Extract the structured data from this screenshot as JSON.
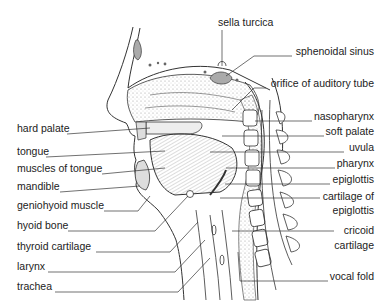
{
  "diagram": {
    "type": "anatomical sagittal section of head and neck",
    "labels_left": [
      {
        "text": "hard palate",
        "x": 17,
        "y": 128
      },
      {
        "text": "tongue",
        "x": 17,
        "y": 151
      },
      {
        "text": "muscles of tongue",
        "x": 17,
        "y": 168
      },
      {
        "text": "mandible",
        "x": 17,
        "y": 186
      },
      {
        "text": "geniohyoid muscle",
        "x": 17,
        "y": 205
      },
      {
        "text": "hyoid bone",
        "x": 17,
        "y": 225
      },
      {
        "text": "thyroid cartilage",
        "x": 17,
        "y": 245
      },
      {
        "text": "larynx",
        "x": 17,
        "y": 266
      },
      {
        "text": "trachea",
        "x": 17,
        "y": 286
      }
    ],
    "labels_top": [
      {
        "text": "sella turcica",
        "x": 218,
        "y": 22
      }
    ],
    "labels_right": [
      {
        "text": "sphenoidal sinus",
        "y": 51
      },
      {
        "text": "orifice of auditory tube",
        "y": 83
      },
      {
        "text": "nasopharynx",
        "y": 116
      },
      {
        "text": "soft palate",
        "y": 131
      },
      {
        "text": "uvula",
        "y": 147
      },
      {
        "text": "pharynx",
        "y": 163
      },
      {
        "text": "epiglottis",
        "y": 179
      },
      {
        "text": "cartilage of",
        "y": 196
      },
      {
        "text": "epiglottis",
        "y": 210
      },
      {
        "text": "cricoid",
        "y": 230
      },
      {
        "text": "cartilage",
        "y": 245
      },
      {
        "text": "vocal fold",
        "y": 276
      }
    ]
  }
}
